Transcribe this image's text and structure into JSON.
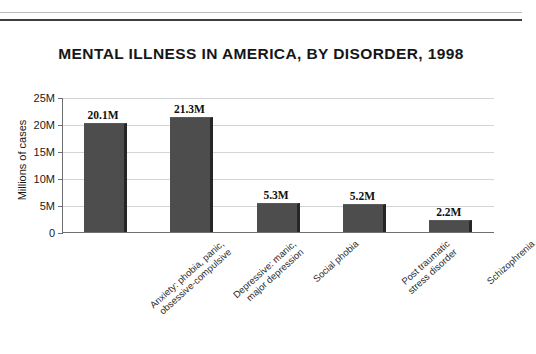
{
  "page": {
    "rule_top_name": "header-rule-thin",
    "rule_bottom_name": "header-rule-thick"
  },
  "chart_data": {
    "type": "bar",
    "title": "MENTAL ILLNESS IN AMERICA, BY DISORDER, 1998",
    "xlabel": "",
    "ylabel": "Millions of cases",
    "ylim": [
      0,
      25
    ],
    "grid": true,
    "legend": "none",
    "ytick_labels": [
      "0",
      "5M",
      "10M",
      "15M",
      "20M",
      "25M"
    ],
    "ytick_values": [
      0,
      5,
      10,
      15,
      20,
      25
    ],
    "categories": [
      "Anxiety: phobia, panic, obsessive-compulsive",
      "Depressive: manic, major depression",
      "Social phobia",
      "Post traumatic stress disorder",
      "Schizophrenia"
    ],
    "category_lines": [
      [
        "Anxiety: phobia, panic,",
        "obsessive-compulsive"
      ],
      [
        "Depressive: manic,",
        "major depression"
      ],
      [
        "Social phobia"
      ],
      [
        "Post traumatic",
        "stress disorder"
      ],
      [
        "Schizophrenia"
      ]
    ],
    "values": [
      20.1,
      21.3,
      5.3,
      5.2,
      2.2
    ],
    "value_labels": [
      "20.1M",
      "21.3M",
      "5.3M",
      "5.2M",
      "2.2M"
    ],
    "bar_color": "#4d4d4d",
    "bar_shadow_color": "#262626",
    "gridline_color": "#d2d4d7",
    "axis_color": "#6d6f73"
  }
}
